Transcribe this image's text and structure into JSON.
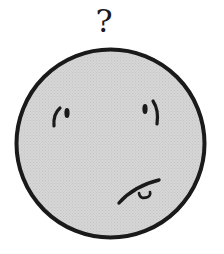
{
  "illustration": {
    "subject": "confused face",
    "symbol": "?",
    "colors": {
      "background": "#ffffff",
      "face_fill": "#d4d4d4",
      "outline": "#1a1a1a"
    }
  }
}
